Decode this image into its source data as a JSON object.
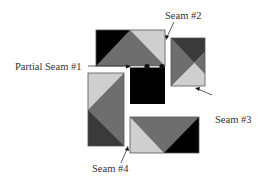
{
  "diagram": {
    "type": "quilt-block-partial-seam-assembly",
    "labels": {
      "partial_seam_1": "Partial Seam #1",
      "seam_2": "Seam #2",
      "seam_3": "Seam #3",
      "seam_4": "Seam #4"
    },
    "colors": {
      "black": "#000000",
      "dark_gray": "#3a3a3a",
      "mid_gray": "#6e6e6e",
      "light_gray": "#cfcfcf",
      "outline": "#555555",
      "seam_line": "#ffffff",
      "dot": "#111111"
    },
    "blocks": [
      {
        "id": "top",
        "pieces": [
          "black",
          "mid_gray",
          "light_gray"
        ]
      },
      {
        "id": "right",
        "pieces": [
          "dark_gray",
          "mid_gray",
          "light_gray"
        ]
      },
      {
        "id": "center",
        "pieces": [
          "black"
        ]
      },
      {
        "id": "left",
        "pieces": [
          "light_gray",
          "mid_gray",
          "dark_gray"
        ]
      },
      {
        "id": "bottom",
        "pieces": [
          "light_gray",
          "mid_gray",
          "black"
        ]
      }
    ]
  }
}
